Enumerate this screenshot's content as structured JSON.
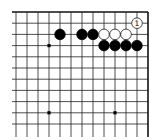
{
  "board": {
    "description": "Go board fragment, top-right corner",
    "grid": {
      "x0": 16,
      "dx": 11,
      "cols": 13,
      "y0": 12,
      "dy": 11.2,
      "rows": 11,
      "right_edge": true,
      "top_edge": true,
      "left_extend": 12,
      "bottom_extend": 137
    },
    "colors": {
      "line": "#222222",
      "edge": "#111111",
      "black": "#000000",
      "white": "#ffffff",
      "background": "#ffffff"
    },
    "star_points": [
      {
        "col": 3,
        "row": 3
      },
      {
        "col": 3,
        "row": 9
      },
      {
        "col": 9,
        "row": 9
      }
    ],
    "stones": [
      {
        "color": "black",
        "col": 4,
        "row": 2
      },
      {
        "color": "black",
        "col": 6,
        "row": 2
      },
      {
        "color": "black",
        "col": 7,
        "row": 2
      },
      {
        "color": "white",
        "col": 8,
        "row": 2
      },
      {
        "color": "white",
        "col": 9,
        "row": 2
      },
      {
        "color": "white",
        "col": 10,
        "row": 2
      },
      {
        "color": "black",
        "col": 8,
        "row": 3
      },
      {
        "color": "black",
        "col": 9,
        "row": 3
      },
      {
        "color": "black",
        "col": 10,
        "row": 3
      },
      {
        "color": "black",
        "col": 11,
        "row": 3
      },
      {
        "color": "white",
        "col": 11,
        "row": 1,
        "label": "1"
      }
    ]
  }
}
